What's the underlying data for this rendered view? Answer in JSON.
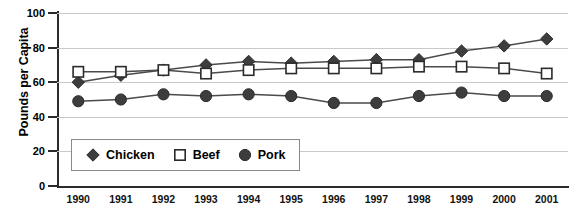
{
  "chart_data": {
    "type": "line",
    "title": "",
    "xlabel": "",
    "ylabel": "Pounds per Capita",
    "ylim": [
      0,
      100
    ],
    "yticks": [
      0,
      20,
      40,
      60,
      80,
      100
    ],
    "grid": true,
    "legend_position": "inside-bottom-left",
    "categories": [
      "1990",
      "1991",
      "1992",
      "1993",
      "1994",
      "1995",
      "1996",
      "1997",
      "1998",
      "1999",
      "2000",
      "2001"
    ],
    "series": [
      {
        "name": "Chicken",
        "marker": "filled-diamond",
        "color": "#3d3d3d",
        "values": [
          60,
          64,
          67,
          70,
          72,
          71,
          72,
          73,
          73,
          78,
          81,
          85
        ]
      },
      {
        "name": "Beef",
        "marker": "open-square",
        "color": "#ffffff",
        "values": [
          66,
          66,
          67,
          65,
          67,
          68,
          68,
          68,
          69,
          69,
          68,
          65
        ]
      },
      {
        "name": "Pork",
        "marker": "filled-circle",
        "color": "#3d3d3d",
        "values": [
          49,
          50,
          53,
          52,
          53,
          52,
          48,
          48,
          52,
          54,
          52,
          52
        ]
      }
    ]
  },
  "axis": {
    "y_title": "Pounds per Capita"
  },
  "legend": {
    "items": [
      {
        "label": "Chicken"
      },
      {
        "label": "Beef"
      },
      {
        "label": "Pork"
      }
    ]
  },
  "colors": {
    "line": "#4a4a4a",
    "marker_fill": "#3d3d3d",
    "marker_stroke": "#2b2b2b",
    "grid": "#c9c9c9",
    "axis": "#2b2b2b",
    "background": "#ffffff"
  }
}
